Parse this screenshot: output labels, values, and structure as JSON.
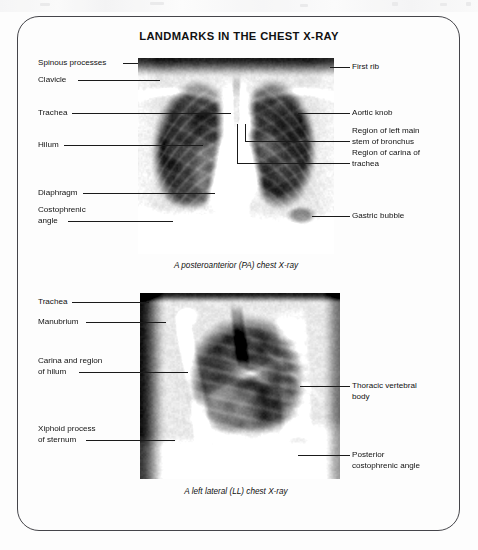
{
  "figure": {
    "title": "LANDMARKS IN THE CHEST X-RAY",
    "frame_color": "#45454a",
    "text_color": "#111111",
    "leader_color": "#1a1a1a"
  },
  "pa_view": {
    "caption": "A posteroanterior (PA) chest X-ray",
    "left_labels": [
      {
        "text": "Spinous processes"
      },
      {
        "text": "Clavicle"
      },
      {
        "text": "Trachea"
      },
      {
        "text": "Hilum"
      },
      {
        "text": "Diaphragm"
      },
      {
        "text": "Costophrenic\nangle"
      }
    ],
    "right_labels": [
      {
        "text": "First rib"
      },
      {
        "text": "Aortic knob"
      },
      {
        "text": "Region of left main\nstem of bronchus"
      },
      {
        "text": "Region of carina of\ntrachea"
      },
      {
        "text": "Gastric bubble"
      }
    ]
  },
  "lateral_view": {
    "caption": "A left lateral (LL) chest X-ray",
    "left_labels": [
      {
        "text": "Trachea"
      },
      {
        "text": "Manubrium"
      },
      {
        "text": "Carina and region\nof hilum"
      },
      {
        "text": "Xiphoid process\nof sternum"
      }
    ],
    "right_labels": [
      {
        "text": "Thoracic vertebral\nbody"
      },
      {
        "text": "Posterior\ncostophrenic angle"
      }
    ]
  }
}
